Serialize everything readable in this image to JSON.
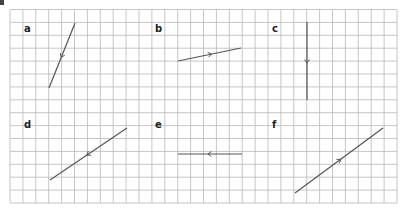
{
  "diagram": {
    "grid": {
      "x0": 10,
      "y0": 9.5,
      "cell": 12.9,
      "cols": 30,
      "rows": 15,
      "color": "#b8b8b8"
    },
    "line_color": "#555555",
    "panels": [
      {
        "label": "a",
        "lx": 24,
        "ly": 32,
        "x1": 49,
        "y1": 88,
        "x2": 75,
        "y2": 23,
        "arrow_dir": "down"
      },
      {
        "label": "b",
        "lx": 155,
        "ly": 32,
        "x1": 178,
        "y1": 61,
        "x2": 241,
        "y2": 48,
        "arrow_dir": "right"
      },
      {
        "label": "c",
        "lx": 272,
        "ly": 32,
        "x1": 307,
        "y1": 22,
        "x2": 307,
        "y2": 100,
        "arrow_dir": "down"
      },
      {
        "label": "d",
        "lx": 24,
        "ly": 128,
        "x1": 50,
        "y1": 180,
        "x2": 127,
        "y2": 128,
        "arrow_dir": "left"
      },
      {
        "label": "e",
        "lx": 155,
        "ly": 128,
        "x1": 178,
        "y1": 154,
        "x2": 242,
        "y2": 154,
        "arrow_dir": "left"
      },
      {
        "label": "f",
        "lx": 272,
        "ly": 128,
        "x1": 295,
        "y1": 193,
        "x2": 383,
        "y2": 128,
        "arrow_dir": "right"
      }
    ]
  }
}
